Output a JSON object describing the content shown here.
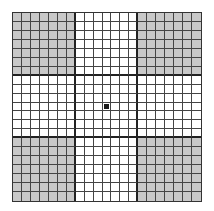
{
  "grid": {
    "rows": 21,
    "cols": 21,
    "block_size": 7,
    "shaded_blocks": [
      [
        0,
        0
      ],
      [
        0,
        2
      ],
      [
        2,
        0
      ],
      [
        2,
        2
      ]
    ],
    "marked_cell": {
      "row": 10,
      "col": 10
    },
    "colors": {
      "shaded": "#c8c8c8",
      "empty": "#ffffff",
      "marked": "#1a1a1a",
      "line": "#444444"
    }
  }
}
